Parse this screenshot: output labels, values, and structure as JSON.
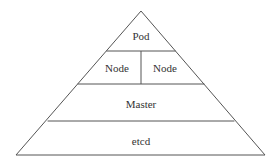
{
  "diagram": {
    "type": "pyramid",
    "layers": [
      {
        "label": "Pod"
      },
      {
        "label": "Node",
        "split": [
          "Node",
          "Node"
        ]
      },
      {
        "label": "Master"
      },
      {
        "label": "etcd"
      }
    ],
    "colors": {
      "stroke": "#555555",
      "text": "#333333",
      "background": "#ffffff"
    }
  }
}
